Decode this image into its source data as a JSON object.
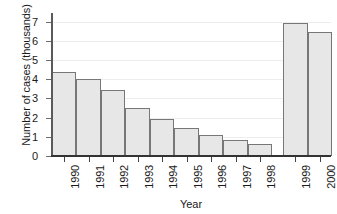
{
  "chart_data": {
    "type": "bar",
    "title": "",
    "subtitle": "",
    "xlabel": "Year",
    "ylabel": "Number of cases (thousands)",
    "categories": [
      "1990",
      "1991",
      "1992",
      "1993",
      "1994",
      "1995",
      "1996",
      "1997",
      "1998",
      "1999",
      "2000"
    ],
    "values": [
      4.4,
      4.0,
      3.45,
      2.5,
      1.95,
      1.45,
      1.1,
      0.85,
      0.65,
      6.95,
      6.45
    ],
    "ylim": [
      0,
      7.3
    ],
    "yticks": [
      0,
      1,
      2,
      3,
      4,
      5,
      6,
      7
    ],
    "ytick_labels": [
      "0",
      "1",
      "2",
      "3",
      "4",
      "5",
      "6",
      "7"
    ],
    "grid": "horizontal",
    "legend": "none",
    "legend_position": "none",
    "annotations": [],
    "bar_fill_color": "#e7e7e7",
    "bar_edge_color": "#777777",
    "gridline_color": "#ededed",
    "axis_color": "#333333"
  }
}
